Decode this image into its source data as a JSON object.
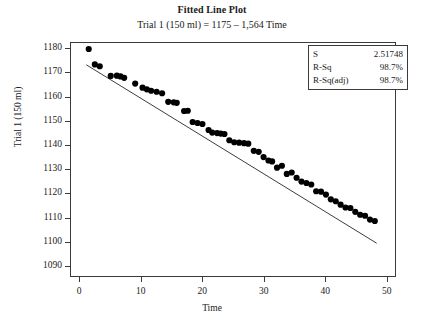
{
  "chart_data": {
    "type": "scatter",
    "title": "Fitted Line Plot",
    "subtitle": "Trial 1 (150 ml) = 1175 – 1,564 Time",
    "xlabel": "Time",
    "ylabel": "Trial 1 (150 ml)",
    "xlim": [
      -1.5,
      51.5
    ],
    "ylim": [
      1085.5,
      1182.5
    ],
    "xticks": [
      0,
      10,
      20,
      30,
      40,
      50
    ],
    "yticks": [
      1090,
      1100,
      1110,
      1120,
      1130,
      1140,
      1150,
      1160,
      1170,
      1180
    ],
    "grid": false,
    "legend": "none",
    "marker_color": "#000000",
    "line_color": "#3a3a3a",
    "fit_line": {
      "intercept": 1175.0,
      "slope": -1.564,
      "x_start": 1.0,
      "x_end": 48.5,
      "label": "Trial 1 (150 ml) = 1175 – 1,564 Time"
    },
    "series": [
      {
        "name": "Trial 1 (150 ml)",
        "x": [
          1.4,
          2.4,
          3.2,
          5.0,
          6.0,
          6.6,
          7.2,
          9.0,
          10.2,
          10.9,
          11.6,
          12.5,
          13.4,
          14.4,
          15.3,
          15.8,
          17.0,
          17.6,
          18.4,
          19.2,
          20.0,
          21.0,
          21.6,
          22.4,
          23.0,
          23.6,
          24.4,
          25.2,
          26.0,
          26.8,
          27.5,
          28.4,
          29.2,
          30.0,
          30.8,
          31.4,
          32.2,
          33.0,
          33.8,
          34.6,
          35.4,
          36.2,
          37.0,
          37.8,
          38.6,
          39.4,
          40.2,
          41.0,
          41.8,
          42.6,
          43.4,
          44.2,
          45.0,
          45.8,
          46.6,
          47.4,
          48.2
        ],
        "y": [
          1180.0,
          1173.6,
          1172.8,
          1168.8,
          1168.9,
          1168.6,
          1168.0,
          1165.6,
          1163.9,
          1163.2,
          1162.6,
          1162.2,
          1161.6,
          1158.0,
          1157.8,
          1157.6,
          1154.2,
          1154.3,
          1149.6,
          1149.2,
          1148.8,
          1146.3,
          1145.2,
          1145.0,
          1144.8,
          1144.6,
          1142.0,
          1141.2,
          1141.0,
          1140.8,
          1140.6,
          1137.6,
          1137.2,
          1135.0,
          1133.6,
          1133.2,
          1130.6,
          1131.4,
          1128.0,
          1128.6,
          1126.4,
          1124.8,
          1124.2,
          1123.6,
          1120.8,
          1120.6,
          1119.4,
          1117.4,
          1116.6,
          1115.2,
          1114.0,
          1113.8,
          1112.2,
          1111.0,
          1110.6,
          1109.0,
          1108.4
        ]
      }
    ],
    "stats": {
      "rows": [
        {
          "key": "S",
          "value": "2.51748"
        },
        {
          "key": "R-Sq",
          "value": "98.7%"
        },
        {
          "key": "R-Sq(adj)",
          "value": "98.7%"
        }
      ]
    }
  }
}
